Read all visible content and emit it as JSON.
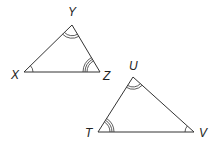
{
  "figure": {
    "triangles": [
      {
        "name": "XYZ",
        "vertices": {
          "X": {
            "label": "X",
            "angle_marks": 1
          },
          "Y": {
            "label": "Y",
            "angle_marks": 2
          },
          "Z": {
            "label": "Z",
            "angle_marks": 3
          }
        }
      },
      {
        "name": "TUV",
        "vertices": {
          "U": {
            "label": "U",
            "angle_marks": 2
          },
          "T": {
            "label": "T",
            "angle_marks": 3
          },
          "V": {
            "label": "V",
            "angle_marks": 1
          }
        }
      }
    ],
    "colors": {
      "stroke": "#333333",
      "text": "#222222",
      "background": "#ffffff"
    }
  }
}
